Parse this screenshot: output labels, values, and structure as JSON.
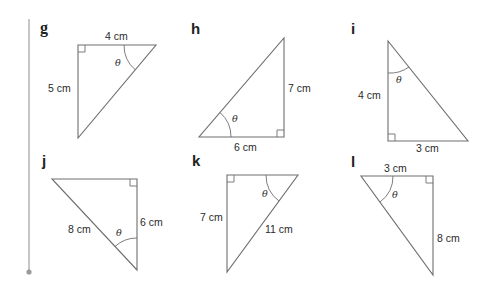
{
  "problems": [
    {
      "letter": "g",
      "labels": [
        "4 cm",
        "5 cm"
      ],
      "angle": "θ"
    },
    {
      "letter": "h",
      "labels": [
        "7 cm",
        "6 cm"
      ],
      "angle": "θ"
    },
    {
      "letter": "i",
      "labels": [
        "4 cm",
        "3 cm"
      ],
      "angle": "θ"
    },
    {
      "letter": "j",
      "labels": [
        "8 cm",
        "6 cm"
      ],
      "angle": "θ"
    },
    {
      "letter": "k",
      "labels": [
        "7 cm",
        "11 cm"
      ],
      "angle": "θ"
    },
    {
      "letter": "l",
      "labels": [
        "3 cm",
        "8 cm"
      ],
      "angle": "θ"
    }
  ],
  "colors": {
    "line": "#6e6e6e",
    "margin_rule": "#a0a0a0",
    "text": "#2b2b2b"
  }
}
